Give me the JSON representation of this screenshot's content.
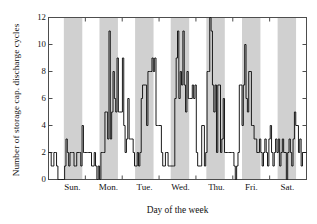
{
  "chart_data": {
    "type": "line",
    "title": "",
    "xlabel": "Day of the week",
    "ylabel": "Number of storage cap. discharge cycles",
    "ylim": [
      0,
      12
    ],
    "yticks": [
      0,
      2,
      4,
      6,
      8,
      10,
      12
    ],
    "xtick_labels": [
      "Sun.",
      "Mon.",
      "Tue.",
      "Wed.",
      "Thu.",
      "Fri.",
      "Sat."
    ],
    "grid": false,
    "legend": null,
    "line_color": "#1a1a1a",
    "band_color": "#d0d0d0",
    "background_color": "#ffffff",
    "axis_color": "#4d4d4d",
    "shaded_bands_note": "Alternating gray vertical bands mark the daytime portion of each weekday",
    "x_units": "samples across one week (168 hourly samples)",
    "series": [
      {
        "name": "storage capacitor discharge cycles",
        "values": [
          2,
          2,
          1,
          1,
          2,
          2,
          1,
          0,
          0,
          0,
          0,
          0,
          1,
          3,
          2,
          1,
          2,
          2,
          2,
          1,
          1,
          2,
          2,
          2,
          1,
          4,
          2,
          2,
          2,
          2,
          2,
          2,
          1,
          1,
          2,
          1,
          0,
          1,
          0,
          2,
          2,
          2,
          5,
          5,
          3,
          11,
          3,
          5,
          8,
          6,
          5,
          9,
          5,
          5,
          5,
          9,
          4,
          2,
          3,
          6,
          3,
          3,
          3,
          2,
          1,
          1,
          2,
          1,
          2,
          6,
          7,
          7,
          7,
          4,
          8,
          8,
          8,
          9,
          8,
          9,
          4,
          4,
          4,
          4,
          2,
          1,
          1,
          2,
          2,
          1,
          1,
          1,
          1,
          1,
          6,
          9,
          11,
          6,
          8,
          7,
          11,
          7,
          5,
          8,
          6,
          6,
          6,
          7,
          6,
          7,
          2,
          1,
          1,
          1,
          4,
          4,
          1,
          2,
          8,
          8,
          12,
          11,
          7,
          5,
          7,
          2,
          7,
          7,
          2,
          3,
          6,
          2,
          2,
          2,
          2,
          2,
          2,
          2,
          1,
          0,
          1,
          2,
          7,
          7,
          4,
          7,
          10,
          6,
          5,
          8,
          8,
          4,
          4,
          3,
          3,
          2,
          2,
          3,
          2,
          1,
          2,
          3,
          2,
          1,
          3,
          4,
          2,
          1,
          2,
          3,
          2,
          3,
          1,
          2,
          3,
          2,
          2,
          0,
          2,
          3,
          2,
          1,
          3,
          5,
          4,
          4,
          2,
          3,
          1,
          2,
          2,
          2
        ]
      }
    ],
    "bands": [
      {
        "label": "Sun.",
        "center_fraction": 0.0952
      },
      {
        "label": "Mon.",
        "center_fraction": 0.2333
      },
      {
        "label": "Tue.",
        "center_fraction": 0.3714
      },
      {
        "label": "Wed.",
        "center_fraction": 0.5095
      },
      {
        "label": "Thu.",
        "center_fraction": 0.6476
      },
      {
        "label": "Fri.",
        "center_fraction": 0.7857
      },
      {
        "label": "Sat.",
        "center_fraction": 0.9238
      }
    ]
  }
}
